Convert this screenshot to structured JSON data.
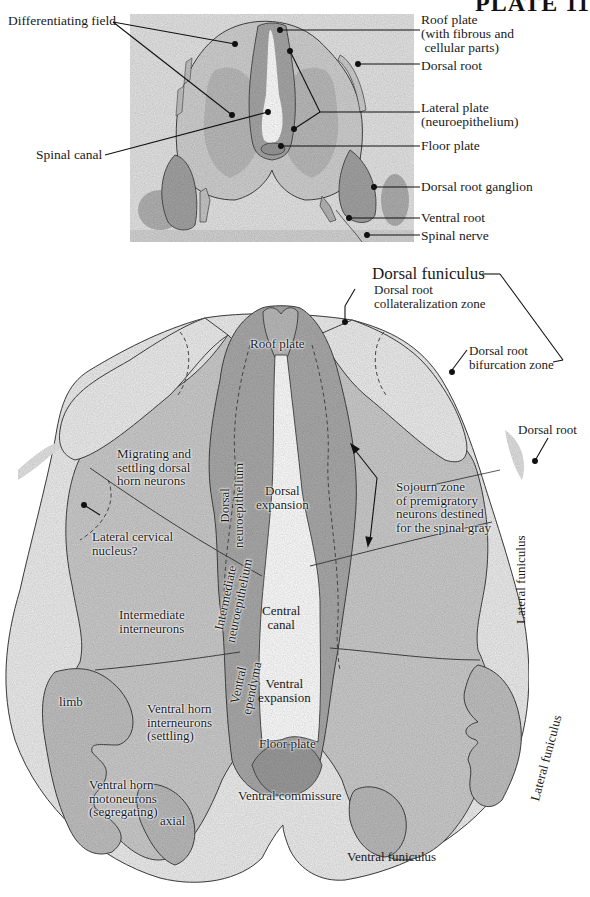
{
  "plate_title": "PLATE 11",
  "top_panel": {
    "labels": {
      "differentiating_field": "Differentiating field",
      "spinal_canal": "Spinal canal",
      "roof_plate": "Roof plate\n(with fibrous and\n cellular parts)",
      "dorsal_root": "Dorsal root",
      "lateral_plate": "Lateral plate\n(neuroepithelium)",
      "floor_plate": "Floor plate",
      "dorsal_root_ganglion": "Dorsal root ganglion",
      "ventral_root": "Ventral root",
      "spinal_nerve": "Spinal nerve"
    }
  },
  "bottom_panel": {
    "labels": {
      "dorsal_funiculus": "Dorsal funiculus",
      "dorsal_root_collateralization_zone": "Dorsal root\ncollateralization zone",
      "dorsal_root_bifurcation_zone": "Dorsal root\nbifurcation zone",
      "dorsal_root": "Dorsal root",
      "roof_plate": "Roof plate",
      "dorsal_neuroepithelium": "Dorsal\nneuroepithelium",
      "dorsal_expansion": "Dorsal\nexpansion",
      "migrating_settling": "Migrating and\nsettling dorsal\nhorn neurons",
      "lateral_cervical_nucleus": "Lateral cervical\nnucleus?",
      "sojourn_zone": "Sojourn zone\nof premigratory\nneurons destined\nfor the spinal gray",
      "lateral_funiculus_upper": "Lateral funiculus",
      "intermediate_neuroepithelium": "Intermediate\nneuroepithelium",
      "central_canal": "Central\ncanal",
      "intermediate_interneurons": "Intermediate\ninterneurons",
      "ventral_ependyma": "Ventral\nependyma",
      "ventral_expansion": "Ventral\nexpansion",
      "limb": "limb",
      "ventral_horn_interneurons": "Ventral horn\ninterneurons\n(settling)",
      "floor_plate": "Floor plate",
      "ventral_horn_motoneurons": "Ventral horn\nmotoneurons\n(segregating)",
      "axial": "axial",
      "ventral_commissure": "Ventral commissure",
      "lateral_funiculus_lower": "Lateral funiculus",
      "ventral_funiculus": "Ventral funiculus"
    }
  },
  "colors": {
    "outline": "#3a3a3a",
    "white_matter": "#eeeeee",
    "gray_matter": "#c9c9c9",
    "neuroepithelium": "#a9a9a9",
    "background": "#ffffff"
  }
}
